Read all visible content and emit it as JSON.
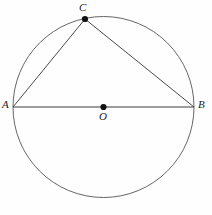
{
  "figure": {
    "name": "circle-with-inscribed-right-triangle",
    "background_color": "#fefefe",
    "stroke_color": "#555555",
    "chord_color": "#4a4a4a",
    "diameter_color": "#3d3d3d",
    "point_color": "#111111",
    "label_color": "#1b1b1b"
  },
  "labels": {
    "a": "A",
    "b": "B",
    "c": "C",
    "o": "O"
  },
  "chart_data": {
    "type": "scatter",
    "title": "",
    "xlabel": "",
    "ylabel": "",
    "grid": false,
    "legend": null,
    "circle": {
      "center_x": 103.5,
      "center_y": 107,
      "radius": 90.5,
      "stroke_width": 0.9
    },
    "points": [
      {
        "label": "A",
        "x": 13,
        "y": 107,
        "on_circle": true,
        "marker": "none"
      },
      {
        "label": "B",
        "x": 194,
        "y": 107,
        "on_circle": true,
        "marker": "none"
      },
      {
        "label": "C",
        "x": 85,
        "y": 19,
        "on_circle": true,
        "marker": "dot"
      },
      {
        "label": "O",
        "x": 103.5,
        "y": 107,
        "on_circle": false,
        "marker": "dot"
      }
    ],
    "segments": [
      {
        "name": "diameter-AB",
        "from": "A",
        "to": "B",
        "x1": 13,
        "y1": 107,
        "x2": 194,
        "y2": 107
      },
      {
        "name": "chord-AC",
        "from": "A",
        "to": "C",
        "x1": 13,
        "y1": 107,
        "x2": 85,
        "y2": 19
      },
      {
        "name": "chord-CB",
        "from": "C",
        "to": "B",
        "x1": 85,
        "y1": 19,
        "x2": 194,
        "y2": 107
      }
    ],
    "marker_radius": 3.1,
    "xlim": [
      0,
      212
    ],
    "ylim": [
      0,
      215
    ]
  }
}
